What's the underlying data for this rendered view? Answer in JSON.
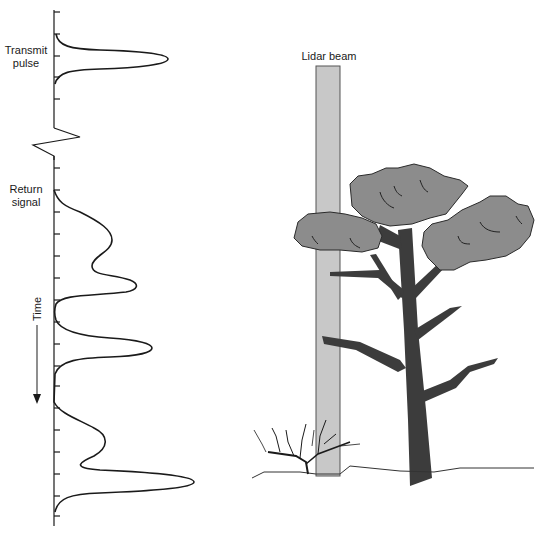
{
  "diagram": {
    "labels": {
      "transmit_line1": "Transmit",
      "transmit_line2": "pulse",
      "return_line1": "Return",
      "return_line2": "signal",
      "time": "Time",
      "lidar_beam": "Lidar beam"
    },
    "colors": {
      "line": "#1a1a1a",
      "beam_fill": "#c8c8c8",
      "beam_stroke": "#555555",
      "canopy_fill": "#8c8c8c",
      "trunk_fill": "#3c3c3c",
      "ground": "#333333"
    }
  }
}
